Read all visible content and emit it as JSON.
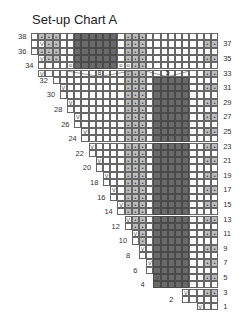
{
  "title": "Set-up Chart A",
  "chart": {
    "columns": 26,
    "rows": 38,
    "cell_w": 7.2,
    "cell_h": 7.3,
    "colors": {
      "purl_gray": "#bdbdbd",
      "no_stitch_dark": "#6a6a6a",
      "grid_line": "#666666"
    },
    "left_labels": [
      "38",
      "36",
      "34",
      "32",
      "30",
      "28",
      "26",
      "24",
      "22",
      "20",
      "18",
      "16",
      "14",
      "12",
      "10",
      "8",
      "6",
      "4",
      "2"
    ],
    "right_labels": [
      "37",
      "35",
      "33",
      "31",
      "29",
      "27",
      "25",
      "23",
      "21",
      "19",
      "17",
      "15",
      "13",
      "11",
      "9",
      "7",
      "5",
      "3",
      "1"
    ],
    "bracket_labels": {
      "left": "8",
      "right": "5"
    },
    "legend_symbols": [
      "V = slip",
      "o = yarn over",
      "• = purl",
      "dark = no stitch"
    ]
  }
}
